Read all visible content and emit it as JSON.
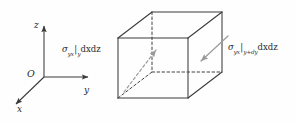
{
  "figure": {
    "name": "shear-stress-cube-diagram",
    "type": "3d-stress-element",
    "background_color": "#fefefe",
    "line_color": "#3a3a3a",
    "arrow_color": "#9a9a9a",
    "text_color": "#2b2b2b"
  },
  "axes": {
    "origin_label": "O",
    "x_label": "x",
    "y_label": "y",
    "z_label": "z"
  },
  "labels": {
    "left_stress": {
      "symbol": "σ",
      "subscript": "yx",
      "bar": "|",
      "evaluated_at": "y",
      "area_element": "dxdz"
    },
    "right_stress": {
      "symbol": "σ",
      "subscript": "yx",
      "bar": "|",
      "evaluated_at_prefix": "y+",
      "evaluated_at_d": "d",
      "evaluated_at_var": "y",
      "area_element": "dxdz"
    }
  },
  "arrows": {
    "left": {
      "name": "stress-arrow-left",
      "style": "dashed",
      "direction": "up-right"
    },
    "right": {
      "name": "stress-arrow-right",
      "style": "solid",
      "direction": "down-left"
    }
  }
}
